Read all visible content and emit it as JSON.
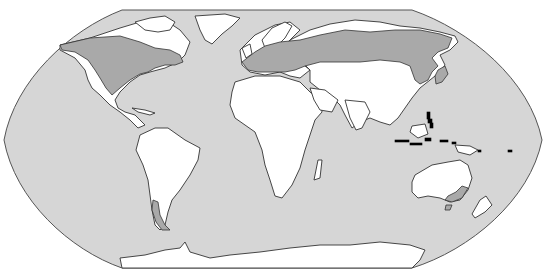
{
  "map": {
    "projection": "Robinson-like world map",
    "colors": {
      "ocean": "#d6d6d6",
      "land": "#ffffff",
      "range": "#a9a9a9",
      "outline": "#333333",
      "islands": "#000000"
    },
    "legend": null,
    "regions_shaded": [
      "Northern North America (Canada / northern USA)",
      "Northern Europe and Siberia band",
      "Northeast Asia / Japan",
      "Southern Chile / Patagonia",
      "Southeastern Australia / Tasmania"
    ]
  }
}
